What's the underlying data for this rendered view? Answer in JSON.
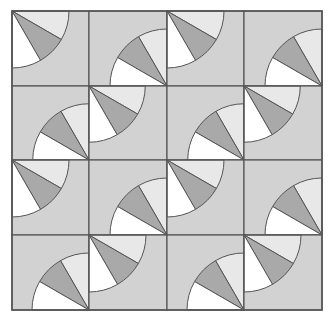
{
  "diagram": {
    "type": "quilt-tile-pattern",
    "grid": {
      "rows": 4,
      "cols": 4,
      "col_edges": [
        12,
        89,
        167,
        244,
        322
      ],
      "row_edges": [
        11,
        86,
        160,
        235,
        310
      ]
    },
    "layout": [
      [
        "A",
        "B",
        "A",
        "B"
      ],
      [
        "B",
        "A",
        "B",
        "A"
      ],
      [
        "A",
        "B",
        "A",
        "B"
      ],
      [
        "B",
        "A",
        "B",
        "A"
      ]
    ],
    "tiles": {
      "A": {
        "corner": "top-left",
        "radius_ratio": 0.76
      },
      "B": {
        "corner": "bottom-right",
        "radius_ratio": 0.76
      }
    },
    "wedges": [
      {
        "name": "light",
        "from_deg": 0,
        "to_deg": 30
      },
      {
        "name": "mid",
        "from_deg": 30,
        "to_deg": 60
      },
      {
        "name": "white",
        "from_deg": 60,
        "to_deg": 90
      }
    ],
    "colors": {
      "background": "#d2d2d2",
      "light": "#e8e8e8",
      "mid": "#a9a9a9",
      "white": "#ffffff",
      "stroke": "#555555"
    }
  }
}
